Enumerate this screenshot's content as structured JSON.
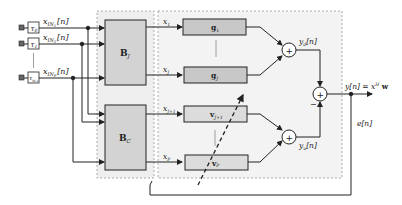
{
  "diagram": {
    "inputs": [
      {
        "delay_label": "τ₀",
        "delay_sym": "τ",
        "delay_sub": "0",
        "signal_base": "x",
        "signal_sub": "IN",
        "signal_subsub": "1",
        "signal_arg": "[n]"
      },
      {
        "delay_label": "τ₁",
        "delay_sym": "τ",
        "delay_sub": "1",
        "signal_base": "x",
        "signal_sub": "IN",
        "signal_subsub": "2",
        "signal_arg": "[n]"
      },
      {
        "delay_label": "τ_{M-1}",
        "delay_sym": "τ",
        "delay_sub": "M-1",
        "signal_base": "x",
        "signal_sub": "IN",
        "signal_subsub": "P",
        "signal_arg": "[n]"
      }
    ],
    "blocks": {
      "bj": {
        "base": "B",
        "sub": "J"
      },
      "bc": {
        "base": "B",
        "sub": "C"
      }
    },
    "branch_signals": [
      {
        "base": "x",
        "sub": "1"
      },
      {
        "base": "x",
        "sub": "J"
      },
      {
        "base": "x",
        "sub": "J+1"
      },
      {
        "base": "x",
        "sub": "P"
      }
    ],
    "weights": [
      {
        "base": "g",
        "sub": "1"
      },
      {
        "base": "g",
        "sub": "J"
      },
      {
        "base": "v",
        "sub": "J+1"
      },
      {
        "base": "v",
        "sub": "P"
      }
    ],
    "summers": {
      "yd": {
        "symbol": "+",
        "label_base": "y",
        "label_sub": "d",
        "label_arg": "[n]"
      },
      "yu": {
        "symbol": "+",
        "label_base": "y",
        "label_sub": "u",
        "label_arg": "[n]"
      },
      "final": {
        "symbol": "+",
        "minus_sign": "−"
      }
    },
    "output": {
      "label_left": "y[n] = x",
      "label_sup": "H",
      "label_right": " w"
    },
    "error": {
      "label": "e[n]"
    },
    "colors": {
      "line": "#222222",
      "block_fill": "#d3d3d3",
      "weight_fill": "#c8c8c8",
      "region_fill": "#f0f0f0",
      "region_border": "#9a9a9a"
    }
  }
}
